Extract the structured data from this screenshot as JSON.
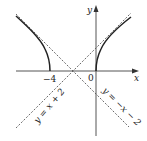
{
  "diagram": {
    "type": "hyperbola-with-asymptotes",
    "colors": {
      "axis": "#555555",
      "curve": "#222222",
      "asymptote": "#444444",
      "background": "#ffffff"
    },
    "axes": {
      "x_label": "x",
      "y_label": "y",
      "origin_label": "0",
      "tick_labels": [
        "−4"
      ]
    },
    "asymptotes": [
      {
        "label": "y = x + 2",
        "slope": 1,
        "intercept": 2
      },
      {
        "label": "y = −x − 2",
        "slope": -1,
        "intercept": -2
      }
    ],
    "curve": {
      "equation": "(x+2)^2/4 - y^2/4 = 1",
      "vertices": [
        [
          -4,
          0
        ],
        [
          0,
          0
        ]
      ],
      "center": [
        -2,
        0
      ]
    }
  }
}
